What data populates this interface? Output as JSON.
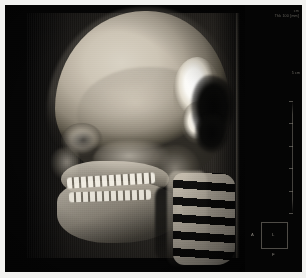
{
  "viewer": {
    "modality": "CT",
    "render_mode": "3D Volume Rendering",
    "view": "Lateral Skull",
    "background_color": "#050505",
    "frame_color": "#f2f2f0",
    "bone_color": "#cdc5b6",
    "highlight_color": "#ffffff"
  },
  "annotations": {
    "top_right": {
      "line1": "cm",
      "line2": "Thk  100  [mm]"
    },
    "scale": {
      "label": "5 cm",
      "unit": "cm",
      "tick_count": 6
    }
  },
  "orientation_cube": {
    "label_left": "A",
    "label_center": "L",
    "label_bottom": "F"
  },
  "anatomy": {
    "regions": [
      "cranial vault",
      "orbit",
      "zygomatic arch",
      "maxilla",
      "mandible",
      "upper dentition",
      "lower dentition",
      "cervical spine",
      "occipital cut plane"
    ]
  }
}
